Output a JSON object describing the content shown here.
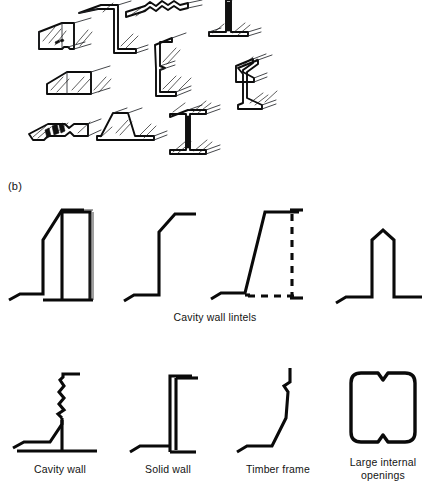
{
  "figure": {
    "kind": "technical-line-drawing",
    "ink_color": "#0a0a0a",
    "background_color": "#ffffff",
    "width_px": 427,
    "height_px": 498
  },
  "panels": [
    {
      "id": "a",
      "label": "",
      "description": "Isometric views of pressed steel lintel sections",
      "item_count": 10
    },
    {
      "id": "b",
      "label": "(b)",
      "description": "Cross-section profiles of lintels by wall type"
    }
  ],
  "panel_a": {
    "items": [
      {
        "name": "box-section-with-perforated-base",
        "row": 1,
        "col": 1
      },
      {
        "name": "tall-z-section",
        "row": 1,
        "col": 2
      },
      {
        "name": "corrugated-top-channel",
        "row": 1,
        "col": 3
      },
      {
        "name": "inverted-t-section",
        "row": 1,
        "col": 4
      },
      {
        "name": "shallow-box-section",
        "row": 2,
        "col": 1
      },
      {
        "name": "stepped-z-section-with-bead",
        "row": 2,
        "col": 2
      },
      {
        "name": "deep-z-section",
        "row": 2,
        "col": 3
      },
      {
        "name": "slotted-flat-plate",
        "row": 3,
        "col": 1
      },
      {
        "name": "trapezoidal-top-hat-section",
        "row": 3,
        "col": 2
      },
      {
        "name": "universal-i-beam-section",
        "row": 3,
        "col": 3
      }
    ]
  },
  "panel_b": {
    "label": "(b)",
    "row1": {
      "caption": "Cavity wall lintels",
      "caption_x": 215,
      "caption_y": 311,
      "profiles": [
        {
          "name": "lintel-sloped-web-with-box",
          "label": ""
        },
        {
          "name": "lintel-plain-angled-toe",
          "label": ""
        },
        {
          "name": "lintel-raking-web-dashed-outline",
          "label": ""
        },
        {
          "name": "lintel-peaked-top",
          "label": ""
        }
      ]
    },
    "row2": {
      "profiles": [
        {
          "name": "profile-cavity-wall",
          "label": "Cavity wall",
          "label_x": 60,
          "label_y": 463
        },
        {
          "name": "profile-solid-wall",
          "label": "Solid wall",
          "label_x": 168,
          "label_y": 463
        },
        {
          "name": "profile-timber-frame",
          "label": "Timber frame",
          "label_x": 278,
          "label_y": 463
        },
        {
          "name": "profile-large-internal-openings",
          "label": "Large internal openings",
          "label_x": 381,
          "label_y": 456
        }
      ]
    }
  },
  "labels": {
    "panel_b": "(b)",
    "cavity_wall_lintels": "Cavity wall lintels",
    "cavity_wall": "Cavity wall",
    "solid_wall": "Solid wall",
    "timber_frame": "Timber frame",
    "large_internal_openings": "Large internal openings",
    "large_internal_line1": "Large internal",
    "large_internal_line2": "openings"
  }
}
